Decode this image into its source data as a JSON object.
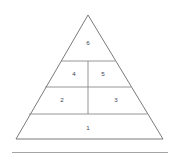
{
  "diagram": {
    "type": "pyramid",
    "title": "",
    "tier_count": 4,
    "segment_count": 6,
    "outline_color": "#6b6b6b",
    "divider_color": "#8a8a8a",
    "label_color": "#3b3f52",
    "background_color": "#ffffff",
    "apex": {
      "x": 88,
      "y": 15
    },
    "base_left": {
      "x": 16,
      "y": 139
    },
    "base_right": {
      "x": 163,
      "y": 139
    },
    "tiers": [
      {
        "index": 4,
        "name": "apex-tier",
        "y_top": 15,
        "y_bottom": 61,
        "segments": [
          {
            "id": "segment-6",
            "label": "6",
            "cx": 88,
            "cy": 43
          }
        ]
      },
      {
        "index": 3,
        "name": "upper-middle-tier",
        "y_top": 61,
        "y_bottom": 87,
        "segments": [
          {
            "id": "segment-4",
            "label": "4",
            "cx": 74,
            "cy": 74
          },
          {
            "id": "segment-5",
            "label": "5",
            "cx": 103,
            "cy": 74
          }
        ]
      },
      {
        "index": 2,
        "name": "lower-middle-tier",
        "y_top": 87,
        "y_bottom": 114,
        "segments": [
          {
            "id": "segment-2",
            "label": "2",
            "cx": 62,
            "cy": 100
          },
          {
            "id": "segment-3",
            "label": "3",
            "cx": 116,
            "cy": 100
          }
        ]
      },
      {
        "index": 1,
        "name": "base-tier",
        "y_top": 114,
        "y_bottom": 139,
        "segments": [
          {
            "id": "segment-1",
            "label": "1",
            "cx": 88,
            "cy": 128
          }
        ]
      }
    ],
    "vertical_divider": {
      "x": 88,
      "y_top": 61,
      "y_bottom": 114
    },
    "horizontal_dividers": [
      {
        "y": 61,
        "x_left": 61,
        "x_right": 115
      },
      {
        "y": 87,
        "x_left": 45,
        "x_right": 131
      },
      {
        "y": 114,
        "x_left": 29,
        "x_right": 147
      }
    ],
    "footer_rule": {
      "y": 152,
      "x_left": 12,
      "x_right": 168,
      "color": "#9a9a9a"
    }
  }
}
